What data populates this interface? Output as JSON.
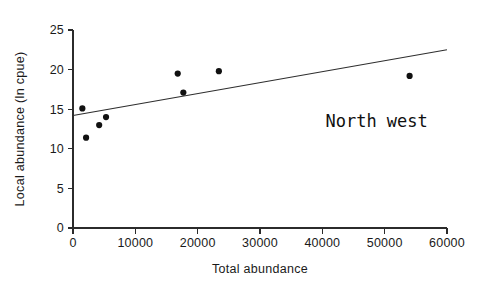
{
  "chart_data": {
    "type": "scatter",
    "title": "",
    "xlabel": "Total abundance",
    "ylabel": "Local abundance (ln cpue)",
    "xlim": [
      0,
      60000
    ],
    "ylim": [
      0,
      25
    ],
    "xticks": [
      0,
      10000,
      20000,
      30000,
      40000,
      50000,
      60000
    ],
    "xtick_labels": [
      "0",
      "10000",
      "20000",
      "30000",
      "40000",
      "50000",
      "60000"
    ],
    "yticks": [
      0,
      5,
      10,
      15,
      20,
      25
    ],
    "ytick_labels": [
      "0",
      "5",
      "10",
      "15",
      "20",
      "25"
    ],
    "grid": false,
    "legend": null,
    "annotations": [
      {
        "text": "North west",
        "x": 40500,
        "y": 12.8
      }
    ],
    "series": [
      {
        "name": "North west",
        "marker": "filled-circle",
        "marker_color": "#111111",
        "points": [
          {
            "x": 1500,
            "y": 15.1
          },
          {
            "x": 2100,
            "y": 11.4
          },
          {
            "x": 4200,
            "y": 13.0
          },
          {
            "x": 5300,
            "y": 14.0
          },
          {
            "x": 16800,
            "y": 19.5
          },
          {
            "x": 17700,
            "y": 17.1
          },
          {
            "x": 23400,
            "y": 19.8
          },
          {
            "x": 54000,
            "y": 19.2
          }
        ]
      }
    ],
    "trendline": {
      "name": "regression-line",
      "color": "#2e2e2e",
      "x_start": 0,
      "y_start": 14.2,
      "x_end": 60000,
      "y_end": 22.5
    }
  }
}
